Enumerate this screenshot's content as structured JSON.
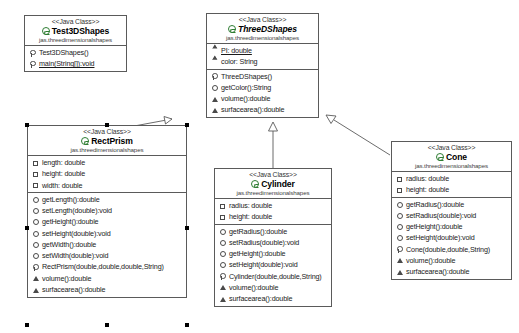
{
  "diagram": {
    "stereotype": "<<Java Class>>",
    "package": "jas.threedimensionalshapes",
    "line_color": "#5a5a5a",
    "class_icon_color": "#2e7d32"
  },
  "classes": {
    "test3dshapes": {
      "stereotype": "<<Java Class>>",
      "name": "Test3DShapes",
      "package": "jas.threedimensionalshapes",
      "attributes": [],
      "methods": [
        {
          "marker": "constructor",
          "text": "Test3DShapes()",
          "static": false
        },
        {
          "marker": "constructor",
          "text": "main(String[]):void",
          "static": true
        }
      ]
    },
    "threedshapes": {
      "stereotype": "<<Java Class>>",
      "name": "ThreeDShapes",
      "abstract": true,
      "package": "jas.threedimensionalshapes",
      "attributes": [
        {
          "marker": "package",
          "text": "PI: double",
          "static": true
        },
        {
          "marker": "protected",
          "text": "color: String",
          "static": false
        }
      ],
      "methods": [
        {
          "marker": "constructor",
          "text": "ThreeDShapes()",
          "static": false
        },
        {
          "marker": "public",
          "text": "getColor():String",
          "static": false
        },
        {
          "marker": "abstract",
          "text": "volume():double",
          "static": false
        },
        {
          "marker": "abstract",
          "text": "surfacearea():double",
          "static": false
        }
      ]
    },
    "rectprism": {
      "stereotype": "<<Java Class>>",
      "name": "RectPrism",
      "package": "jas.threedimensionalshapes",
      "selected": true,
      "attributes": [
        {
          "marker": "private",
          "text": "length: double"
        },
        {
          "marker": "private",
          "text": "height: double"
        },
        {
          "marker": "private",
          "text": "width: double"
        }
      ],
      "methods": [
        {
          "marker": "public",
          "text": "getLength():double"
        },
        {
          "marker": "public",
          "text": "setLength(double):void"
        },
        {
          "marker": "public",
          "text": "getHeight():double"
        },
        {
          "marker": "public",
          "text": "setHeight(double):void"
        },
        {
          "marker": "public",
          "text": "getWidth():double"
        },
        {
          "marker": "public",
          "text": "setWidth(double):void"
        },
        {
          "marker": "constructor",
          "text": "RectPrism(double,double,double,String)"
        },
        {
          "marker": "abstract",
          "text": "volume():double"
        },
        {
          "marker": "abstract",
          "text": "surfacearea():double"
        }
      ]
    },
    "cylinder": {
      "stereotype": "<<Java Class>>",
      "name": "Cylinder",
      "package": "jas.threedimensionalshapes",
      "attributes": [
        {
          "marker": "private",
          "text": "radius: double"
        },
        {
          "marker": "private",
          "text": "height: double"
        }
      ],
      "methods": [
        {
          "marker": "public",
          "text": "getRadius():double"
        },
        {
          "marker": "public",
          "text": "setRadius(double):void"
        },
        {
          "marker": "public",
          "text": "getHeight():double"
        },
        {
          "marker": "public",
          "text": "setHeight(double):void"
        },
        {
          "marker": "constructor",
          "text": "Cylinder(double,double,String)"
        },
        {
          "marker": "abstract",
          "text": "volume():double"
        },
        {
          "marker": "abstract",
          "text": "surfacearea():double"
        }
      ]
    },
    "cone": {
      "stereotype": "<<Java Class>>",
      "name": "Cone",
      "package": "jas.threedimensionalshapes",
      "attributes": [
        {
          "marker": "private",
          "text": "radius: double"
        },
        {
          "marker": "private",
          "text": "height: double"
        }
      ],
      "methods": [
        {
          "marker": "public",
          "text": "getRadius():double"
        },
        {
          "marker": "public",
          "text": "setRadius(double):void"
        },
        {
          "marker": "public",
          "text": "getHeight():double"
        },
        {
          "marker": "public",
          "text": "setHeight(double):void"
        },
        {
          "marker": "constructor",
          "text": "Cone(double,double,String)"
        },
        {
          "marker": "abstract",
          "text": "volume():double"
        },
        {
          "marker": "abstract",
          "text": "surfacearea():double"
        }
      ]
    }
  },
  "relationships": [
    {
      "type": "generalization",
      "from": "RectPrism",
      "to": "ThreeDShapes"
    },
    {
      "type": "generalization",
      "from": "Cylinder",
      "to": "ThreeDShapes"
    },
    {
      "type": "generalization",
      "from": "Cone",
      "to": "ThreeDShapes"
    }
  ]
}
